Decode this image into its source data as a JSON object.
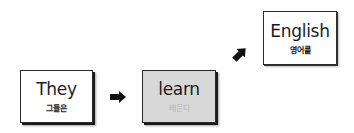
{
  "diagram": {
    "type": "word-order-flow",
    "cards": [
      {
        "id": "they",
        "word": "They",
        "gloss": "그들은",
        "background": "#ffffff",
        "highlighted": false
      },
      {
        "id": "learn",
        "word": "learn",
        "gloss": "배운다",
        "background": "#d8d8d8",
        "highlighted": true
      },
      {
        "id": "english",
        "word": "English",
        "gloss": "영어를",
        "background": "#ffffff",
        "highlighted": false
      }
    ],
    "arrows": [
      {
        "from": "they",
        "to": "learn",
        "direction": "right",
        "icon": "arrow-right-icon"
      },
      {
        "from": "learn",
        "to": "english",
        "direction": "up-right",
        "icon": "arrow-up-right-icon"
      }
    ],
    "colors": {
      "card_border": "#2a2a2a",
      "highlight_fill": "#d8d8d8",
      "faded_gloss": "#b9b9b9",
      "arrow": "#111111"
    }
  }
}
